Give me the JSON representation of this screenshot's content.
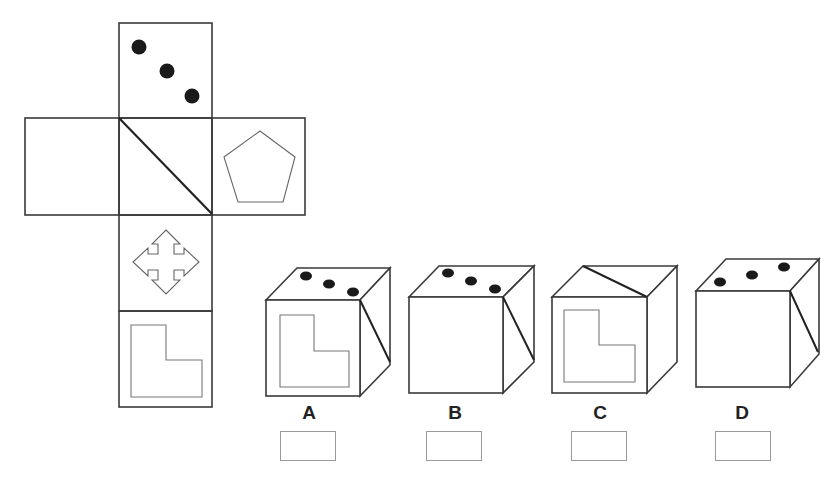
{
  "puzzle": {
    "type": "cube-net folding",
    "net": {
      "faces": [
        {
          "position": "top",
          "content": "three-dots-diagonal"
        },
        {
          "position": "middle-left",
          "content": "blank"
        },
        {
          "position": "center",
          "content": "diagonal-line"
        },
        {
          "position": "middle-right",
          "content": "pentagon"
        },
        {
          "position": "below-center",
          "content": "four-way-arrow"
        },
        {
          "position": "bottom",
          "content": "L-shape"
        }
      ]
    },
    "options": [
      {
        "label": "A",
        "top": "three-dots",
        "front": "L-shape",
        "right": "diagonal-line"
      },
      {
        "label": "B",
        "top": "three-dots",
        "front": "blank",
        "right": "diagonal-line"
      },
      {
        "label": "C",
        "top": "diagonal-line",
        "front": "L-shape",
        "right": "blank"
      },
      {
        "label": "D",
        "top": "three-dots",
        "front": "blank",
        "right": "diagonal-line"
      }
    ]
  },
  "colors": {
    "stroke": "#333333",
    "light_stroke": "#777777",
    "dot": "#1a1a1a",
    "answer_box_border": "#9a9a9a"
  }
}
